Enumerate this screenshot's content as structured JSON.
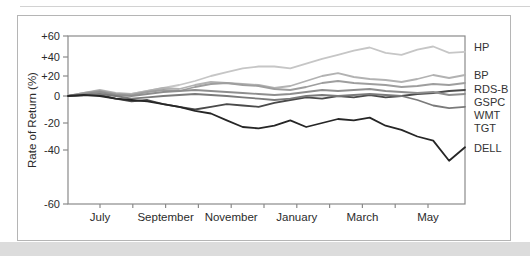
{
  "figure": {
    "frame_border_color": "#b5b5b5",
    "bottom_band_color": "#dcdcdc",
    "axis_color": "#8a8a8a",
    "text_color": "#2b2b2b"
  },
  "chart_data": {
    "type": "line",
    "title": "",
    "xlabel": "",
    "ylabel": "Rate of Return (%)",
    "ylim": [
      -60,
      60
    ],
    "grid": false,
    "legend_position": "right-outside",
    "x_tick_labels": [
      "July",
      "September",
      "November",
      "January",
      "March",
      "May"
    ],
    "y_tick_values": [
      60,
      40,
      20,
      0,
      -20,
      -40,
      -60
    ],
    "y_tick_labels": [
      "+60",
      "+40",
      "+20",
      "0",
      "-20",
      "-40",
      "-60"
    ],
    "x_range_note": "weekly-spaced samples, June through mid-June of following year",
    "series": [
      {
        "name": "HP",
        "color": "#c6c6c6",
        "values": [
          0,
          1,
          2,
          1,
          2,
          5,
          8,
          11,
          15,
          20,
          24,
          28,
          30,
          30,
          28,
          33,
          38,
          42,
          46,
          49,
          44,
          42,
          47,
          50,
          44,
          45
        ]
      },
      {
        "name": "BP",
        "color": "#b2b2b2",
        "values": [
          0,
          3,
          6,
          3,
          2,
          5,
          8,
          7,
          11,
          14,
          13,
          12,
          11,
          8,
          10,
          15,
          20,
          23,
          19,
          17,
          16,
          14,
          17,
          21,
          18,
          21
        ]
      },
      {
        "name": "RDS-B",
        "color": "#9e9e9e",
        "values": [
          0,
          3,
          5,
          2,
          1,
          4,
          6,
          5,
          9,
          12,
          13,
          11,
          10,
          7,
          6,
          9,
          13,
          15,
          13,
          12,
          11,
          9,
          10,
          12,
          11,
          13
        ]
      },
      {
        "name": "GSPC",
        "color": "#4a4a4a",
        "values": [
          0,
          1,
          1,
          -2,
          -4,
          -3,
          -6,
          -8,
          -10,
          -8,
          -6,
          -7,
          -8,
          -5,
          -3,
          -1,
          -2,
          0,
          -1,
          1,
          -1,
          0,
          2,
          3,
          5,
          6
        ]
      },
      {
        "name": "WMT",
        "color": "#8e8e8e",
        "values": [
          0,
          2,
          4,
          1,
          0,
          2,
          4,
          5,
          6,
          5,
          4,
          3,
          2,
          1,
          2,
          4,
          6,
          5,
          6,
          7,
          5,
          4,
          3,
          4,
          1,
          2
        ]
      },
      {
        "name": "TGT",
        "color": "#7a7a7a",
        "values": [
          0,
          1,
          2,
          0,
          -2,
          -1,
          0,
          1,
          2,
          1,
          0,
          -1,
          -2,
          -3,
          -2,
          0,
          1,
          0,
          1,
          2,
          1,
          0,
          -3,
          -7,
          -9,
          -8
        ]
      },
      {
        "name": "DELL",
        "color": "#262626",
        "values": [
          0,
          1,
          0,
          -2,
          -3,
          -4,
          -6,
          -8,
          -11,
          -13,
          -18,
          -23,
          -24,
          -22,
          -18,
          -23,
          -20,
          -17,
          -18,
          -16,
          -22,
          -25,
          -30,
          -33,
          -44,
          -38
        ]
      }
    ],
    "right_labels_top_to_bottom": [
      "HP",
      "BP",
      "RDS-B",
      "GSPC",
      "WMT",
      "TGT",
      "DELL"
    ]
  }
}
